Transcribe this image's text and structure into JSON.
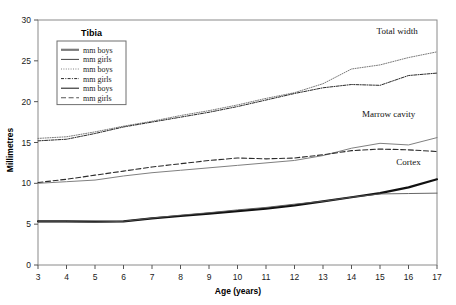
{
  "chart_data": {
    "type": "line",
    "title": "",
    "xlabel": "Age (years)",
    "ylabel": "Millimetres",
    "xlim": [
      3,
      17
    ],
    "ylim": [
      0,
      30
    ],
    "xticks": [
      3,
      4,
      5,
      6,
      7,
      8,
      9,
      10,
      11,
      12,
      13,
      14,
      15,
      16,
      17
    ],
    "yticks": [
      0,
      5,
      10,
      15,
      20,
      25,
      30
    ],
    "grid": false,
    "legend_position": "top-left-inside",
    "legend_title": "Tibia",
    "x": [
      3,
      4,
      5,
      6,
      7,
      8,
      9,
      10,
      11,
      12,
      13,
      14,
      15,
      16,
      17
    ],
    "series": [
      {
        "name": "Total width mm boys",
        "group": "Total width",
        "sex": "boys",
        "style": "fine-dotted",
        "color": "#7a7a7a",
        "values": [
          15.5,
          15.7,
          16.3,
          17.0,
          17.6,
          18.3,
          18.9,
          19.6,
          20.4,
          21.1,
          22.2,
          24.0,
          24.5,
          25.4,
          26.1
        ]
      },
      {
        "name": "Total width mm girls",
        "group": "Total width",
        "sex": "girls",
        "style": "dash-dot",
        "color": "#2b2b2b",
        "values": [
          15.2,
          15.4,
          16.1,
          16.9,
          17.5,
          18.1,
          18.7,
          19.4,
          20.2,
          21.0,
          21.7,
          22.1,
          22.0,
          23.2,
          23.5
        ]
      },
      {
        "name": "Marrow cavity mm boys",
        "group": "Marrow cavity",
        "sex": "boys",
        "style": "solid-grey",
        "color": "#808080",
        "values": [
          10.0,
          10.2,
          10.4,
          10.9,
          11.3,
          11.6,
          11.9,
          12.2,
          12.5,
          12.8,
          13.4,
          14.3,
          14.9,
          14.7,
          15.6
        ]
      },
      {
        "name": "Marrow cavity mm girls",
        "group": "Marrow cavity",
        "sex": "girls",
        "style": "long-dash",
        "color": "#2b2b2b",
        "values": [
          10.1,
          10.5,
          11.0,
          11.5,
          12.0,
          12.4,
          12.8,
          13.1,
          13.0,
          13.1,
          13.5,
          14.0,
          14.2,
          14.1,
          13.9
        ]
      },
      {
        "name": "Cortex mm boys",
        "group": "Cortex",
        "sex": "boys",
        "style": "thick-solid",
        "color": "#111111",
        "values": [
          5.35,
          5.35,
          5.3,
          5.35,
          5.7,
          6.0,
          6.3,
          6.6,
          6.9,
          7.3,
          7.8,
          8.3,
          8.8,
          9.5,
          10.5
        ]
      },
      {
        "name": "Cortex mm girls",
        "group": "Cortex",
        "sex": "girls",
        "style": "thin-solid",
        "color": "#555555",
        "values": [
          5.3,
          5.3,
          5.25,
          5.35,
          5.75,
          6.1,
          6.4,
          6.75,
          7.05,
          7.45,
          7.8,
          8.3,
          8.7,
          8.75,
          8.8
        ]
      }
    ],
    "annotations": [
      {
        "text": "Total width",
        "x": 15.6,
        "y": 28.3
      },
      {
        "text": "Marrow cavity",
        "x": 15.3,
        "y": 18.1
      },
      {
        "text": "Cortex",
        "x": 16.0,
        "y": 12.2
      }
    ]
  },
  "legend": {
    "title": "Tibia",
    "items": [
      {
        "label": "mm boys",
        "style": "thick-solid"
      },
      {
        "label": "mm girls",
        "style": "thin-solid"
      },
      {
        "label": "mm boys",
        "style": "fine-dotted"
      },
      {
        "label": "mm girls",
        "style": "dash-dot"
      },
      {
        "label": "mm boys",
        "style": "solid-grey"
      },
      {
        "label": "mm girls",
        "style": "long-dash"
      }
    ]
  }
}
